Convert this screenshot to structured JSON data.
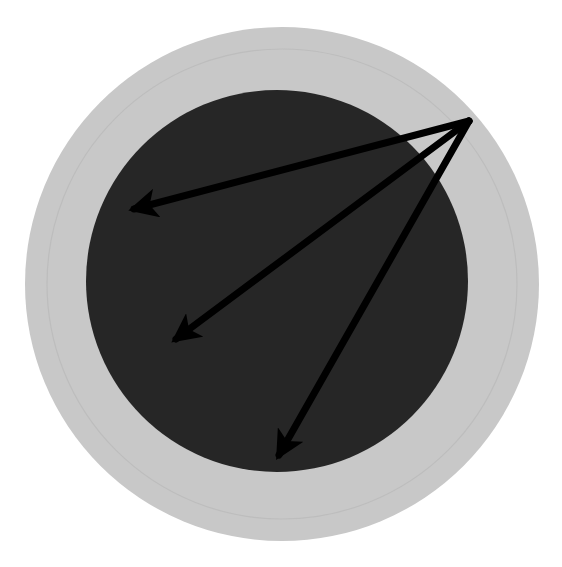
{
  "canvas": {
    "width": 562,
    "height": 567,
    "background": "#ffffff"
  },
  "colors": {
    "outer_disc": "#c8c8c8",
    "inner_ring_line": "#bdbdbd",
    "core_disc": "#262626",
    "arrow": "#000000"
  },
  "shapes": {
    "outer_disc": {
      "cx": 282,
      "cy": 284,
      "r": 257
    },
    "inner_ring": {
      "cx": 282,
      "cy": 284,
      "r": 235
    },
    "core_disc": {
      "cx": 277,
      "cy": 281,
      "r": 191
    }
  },
  "arrows": {
    "origin": {
      "x": 469,
      "y": 121
    },
    "stroke_width": 7,
    "items": [
      {
        "label": "arrow-1",
        "tip": {
          "x": 134,
          "y": 209
        }
      },
      {
        "label": "arrow-2",
        "tip": {
          "x": 176,
          "y": 339
        }
      },
      {
        "label": "arrow-3",
        "tip": {
          "x": 279,
          "y": 455
        }
      }
    ]
  }
}
